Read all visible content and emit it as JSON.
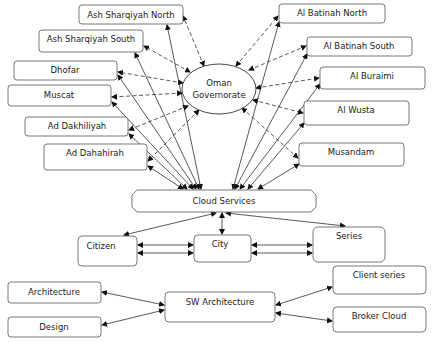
{
  "diagram": {
    "center": {
      "id": "oman",
      "label_lines": [
        "Oman",
        "Governorate"
      ],
      "shape": "ellipse"
    },
    "hub": {
      "id": "cloud",
      "label": "Cloud Services",
      "shape": "octagon"
    },
    "governorates_left": [
      {
        "id": "ash-sharqiyah-north",
        "label": "Ash Sharqiyah North"
      },
      {
        "id": "ash-sharqiyah-south",
        "label": "Ash Sharqiyah South"
      },
      {
        "id": "dhofar",
        "label": "Dhofar"
      },
      {
        "id": "muscat",
        "label": "Muscat"
      },
      {
        "id": "ad-dakhiliyah",
        "label": "Ad Dakhiliyah"
      },
      {
        "id": "ad-dahahirah",
        "label": "Ad Dahahirah"
      }
    ],
    "governorates_right": [
      {
        "id": "al-batinah-north",
        "label": "Al Batinah North"
      },
      {
        "id": "al-batinah-south",
        "label": "Al Batinah South"
      },
      {
        "id": "al-buraimi",
        "label": "Al Buraimi"
      },
      {
        "id": "al-wusta",
        "label": "Al Wusta"
      },
      {
        "id": "musandam",
        "label": "Musandam"
      }
    ],
    "services": [
      {
        "id": "citizen",
        "label": "Citizen"
      },
      {
        "id": "city",
        "label": "City"
      },
      {
        "id": "series",
        "label": "Series"
      }
    ],
    "architecture": {
      "center": {
        "id": "sw-architecture",
        "label": "SW Architecture"
      },
      "left": [
        {
          "id": "architecture",
          "label": "Architecture"
        },
        {
          "id": "design",
          "label": "Design"
        }
      ],
      "right": [
        {
          "id": "client-series",
          "label": "Client series"
        },
        {
          "id": "broker-cloud",
          "label": "Broker Cloud"
        }
      ]
    },
    "edges": [
      {
        "from": "oman",
        "to": "ash-sharqiyah-north",
        "style": "dashed",
        "dir": "both"
      },
      {
        "from": "oman",
        "to": "ash-sharqiyah-south",
        "style": "dashed",
        "dir": "both"
      },
      {
        "from": "oman",
        "to": "dhofar",
        "style": "dashed",
        "dir": "both"
      },
      {
        "from": "oman",
        "to": "muscat",
        "style": "dashed",
        "dir": "both"
      },
      {
        "from": "oman",
        "to": "ad-dakhiliyah",
        "style": "dashed",
        "dir": "both"
      },
      {
        "from": "oman",
        "to": "ad-dahahirah",
        "style": "dashed",
        "dir": "both"
      },
      {
        "from": "oman",
        "to": "al-batinah-north",
        "style": "dashed",
        "dir": "both"
      },
      {
        "from": "oman",
        "to": "al-batinah-south",
        "style": "dashed",
        "dir": "both"
      },
      {
        "from": "oman",
        "to": "al-buraimi",
        "style": "dashed",
        "dir": "both"
      },
      {
        "from": "oman",
        "to": "al-wusta",
        "style": "dashed",
        "dir": "both"
      },
      {
        "from": "oman",
        "to": "musandam",
        "style": "dashed",
        "dir": "both"
      },
      {
        "from": "cloud",
        "to": "ash-sharqiyah-north",
        "style": "solid",
        "dir": "both"
      },
      {
        "from": "cloud",
        "to": "ash-sharqiyah-south",
        "style": "solid",
        "dir": "both"
      },
      {
        "from": "cloud",
        "to": "dhofar",
        "style": "solid",
        "dir": "both"
      },
      {
        "from": "cloud",
        "to": "muscat",
        "style": "solid",
        "dir": "both"
      },
      {
        "from": "cloud",
        "to": "ad-dakhiliyah",
        "style": "solid",
        "dir": "both"
      },
      {
        "from": "cloud",
        "to": "ad-dahahirah",
        "style": "solid",
        "dir": "both"
      },
      {
        "from": "cloud",
        "to": "al-batinah-north",
        "style": "solid",
        "dir": "both"
      },
      {
        "from": "cloud",
        "to": "al-batinah-south",
        "style": "solid",
        "dir": "both"
      },
      {
        "from": "cloud",
        "to": "al-buraimi",
        "style": "solid",
        "dir": "both"
      },
      {
        "from": "cloud",
        "to": "al-wusta",
        "style": "solid",
        "dir": "both"
      },
      {
        "from": "cloud",
        "to": "musandam",
        "style": "solid",
        "dir": "both"
      },
      {
        "from": "cloud",
        "to": "citizen",
        "style": "solid",
        "dir": "both"
      },
      {
        "from": "cloud",
        "to": "city",
        "style": "solid",
        "dir": "both"
      },
      {
        "from": "cloud",
        "to": "series",
        "style": "solid",
        "dir": "both"
      },
      {
        "from": "citizen",
        "to": "city",
        "style": "solid",
        "dir": "both",
        "count": 2
      },
      {
        "from": "city",
        "to": "series",
        "style": "solid",
        "dir": "both",
        "count": 2
      },
      {
        "from": "sw-architecture",
        "to": "architecture",
        "style": "solid",
        "dir": "both"
      },
      {
        "from": "sw-architecture",
        "to": "design",
        "style": "solid",
        "dir": "both"
      },
      {
        "from": "sw-architecture",
        "to": "client-series",
        "style": "solid",
        "dir": "both"
      },
      {
        "from": "sw-architecture",
        "to": "broker-cloud",
        "style": "solid",
        "dir": "both"
      }
    ]
  }
}
